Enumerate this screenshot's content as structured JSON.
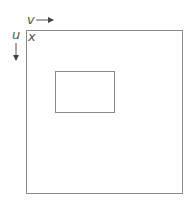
{
  "diagram": {
    "axis_labels": {
      "horizontal": "v",
      "vertical": "u",
      "corner": "x"
    },
    "colors": {
      "stroke": "#8a8a8a",
      "text": "#555555",
      "arrow": "#444444"
    },
    "shapes": [
      {
        "name": "outer-image-region",
        "description": "outer rectangle"
      },
      {
        "name": "inner-subregion",
        "description": "inner rectangle"
      }
    ]
  }
}
